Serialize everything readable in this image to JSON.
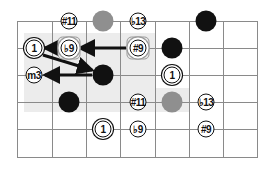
{
  "diagram": {
    "title": "",
    "colors": {
      "grid": "#8a8a8a",
      "shade": "#ececec",
      "note_black": "#111111",
      "note_gray": "#8f8f8f",
      "box_frame": "#9a9a9a"
    },
    "grid": {
      "vertical_lines_x": [
        17,
        52,
        86,
        120,
        155,
        189,
        223,
        257
      ],
      "horizontal_lines_y": [
        21,
        48,
        75,
        102,
        129,
        157
      ]
    },
    "shaded_regions": [
      {
        "x": 24,
        "y": 33,
        "w": 131,
        "h": 79
      },
      {
        "x": 155,
        "y": 88,
        "w": 34,
        "h": 24
      }
    ],
    "notes": [
      {
        "id": "n1",
        "type": "label",
        "text": "#11",
        "x": 69,
        "y": 21
      },
      {
        "id": "n2",
        "type": "gdot",
        "text": "",
        "x": 103,
        "y": 21
      },
      {
        "id": "n3",
        "type": "label",
        "text": "♭13",
        "x": 138,
        "y": 21
      },
      {
        "id": "n4",
        "type": "dot",
        "text": "",
        "x": 206,
        "y": 21
      },
      {
        "id": "n5",
        "type": "root",
        "text": "1",
        "x": 34,
        "y": 48
      },
      {
        "id": "n6",
        "type": "boxed",
        "text": "♭9",
        "x": 69,
        "y": 48
      },
      {
        "id": "n7",
        "type": "boxed",
        "text": "#9",
        "x": 138,
        "y": 48
      },
      {
        "id": "n8",
        "type": "dot",
        "text": "",
        "x": 172,
        "y": 48
      },
      {
        "id": "n9",
        "type": "label",
        "text": "m3",
        "x": 34,
        "y": 75
      },
      {
        "id": "n10",
        "type": "dot",
        "text": "",
        "x": 103,
        "y": 75
      },
      {
        "id": "n11",
        "type": "root",
        "text": "1",
        "x": 172,
        "y": 75
      },
      {
        "id": "n12",
        "type": "dot",
        "text": "",
        "x": 69,
        "y": 102
      },
      {
        "id": "n13",
        "type": "label",
        "text": "#11",
        "x": 138,
        "y": 102
      },
      {
        "id": "n14",
        "type": "gdot",
        "text": "",
        "x": 172,
        "y": 102
      },
      {
        "id": "n15",
        "type": "label",
        "text": "♭13",
        "x": 206,
        "y": 102
      },
      {
        "id": "n16",
        "type": "root",
        "text": "1",
        "x": 103,
        "y": 129
      },
      {
        "id": "n17",
        "type": "label",
        "text": "♭9",
        "x": 138,
        "y": 129
      },
      {
        "id": "n18",
        "type": "label",
        "text": "#9",
        "x": 206,
        "y": 129
      }
    ],
    "arrows": [
      {
        "from": "#9 (row 2)",
        "to": "♭9 (row 2)",
        "x1": 126,
        "y1": 48,
        "x2": 80,
        "y2": 48
      },
      {
        "from": "♭9 (row 2)",
        "to": "1 (row 2)",
        "x1": 58,
        "y1": 48,
        "x2": 45,
        "y2": 48
      },
      {
        "from": "1 (row 2)",
        "to": "dot (row 3)",
        "x1": 43,
        "y1": 55,
        "x2": 92,
        "y2": 70
      },
      {
        "from": "dot (row 3)",
        "to": "m3 (row 3)",
        "x1": 92,
        "y1": 75,
        "x2": 45,
        "y2": 75
      }
    ]
  }
}
